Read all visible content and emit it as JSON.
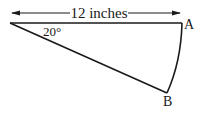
{
  "diagram": {
    "type": "sector",
    "dimension_label": "12 inches",
    "angle_label": "20°",
    "point_a_label": "A",
    "point_b_label": "B",
    "colors": {
      "stroke": "#1a1a1a",
      "background": "#ffffff"
    }
  }
}
